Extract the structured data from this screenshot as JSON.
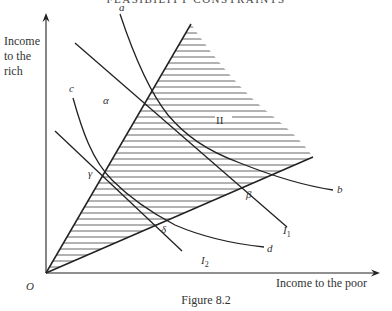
{
  "header": {
    "running_title": "FEASIBILITY CONSTRAINTS"
  },
  "figure": {
    "caption": "Figure 8.2",
    "axes": {
      "y_label_lines": [
        "Income",
        "to the",
        "rich"
      ],
      "x_label": "Income to the poor",
      "origin_label": "O"
    },
    "curve_labels": {
      "a": "a",
      "b": "b",
      "c": "c",
      "d": "d",
      "I1_main": "I",
      "I1_sub": "1",
      "I2_main": "I",
      "I2_sub": "2"
    },
    "point_labels": {
      "alpha": "α",
      "beta": "β",
      "gamma": "γ",
      "delta": "δ"
    },
    "region_label": "II",
    "colors": {
      "ink": "#222222",
      "hatch": "#555555",
      "background": "#ffffff"
    }
  }
}
